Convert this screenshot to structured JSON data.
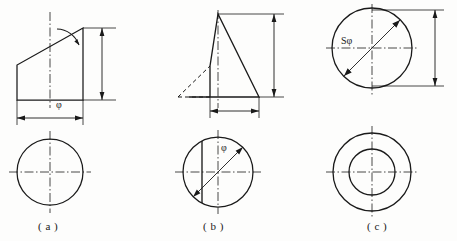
{
  "sheet": {
    "title": "Engineering drawing — three orthographic projection figures",
    "background_color": "#fdfdfc",
    "line_color": "#1a1a1a",
    "width": 457,
    "height": 241
  },
  "figures": [
    {
      "id": "figure-a",
      "caption": "( a )",
      "description": "Truncated cylinder — front view with oblique cut and angle dimension, top view circle",
      "dimensions": {
        "diameter_label": "φ",
        "height_label": "",
        "angle_label": ""
      }
    },
    {
      "id": "figure-b",
      "caption": "( b )",
      "description": "Cone cut by a vertical plane — front view triangle with hidden outline, top view circle with chord and diameter dimension",
      "dimensions": {
        "diameter_label": "φ",
        "height_label": "",
        "width_label": ""
      }
    },
    {
      "id": "figure-c",
      "caption": "( c )",
      "description": "Sphere with through hole — top view circle with spherical diameter, bottom view concentric circles",
      "dimensions": {
        "sphere_diameter_label": "Sφ",
        "height_label": ""
      }
    }
  ],
  "captions": {
    "a": "( a )",
    "b": "( b )",
    "c": "( c )"
  },
  "labels": {
    "phi_a": "φ",
    "phi_b": "φ",
    "sphi_c": "Sφ"
  },
  "colors": {
    "line": "#1a1a1a",
    "background": "#fdfdfc",
    "text": "#1a1a1a"
  }
}
